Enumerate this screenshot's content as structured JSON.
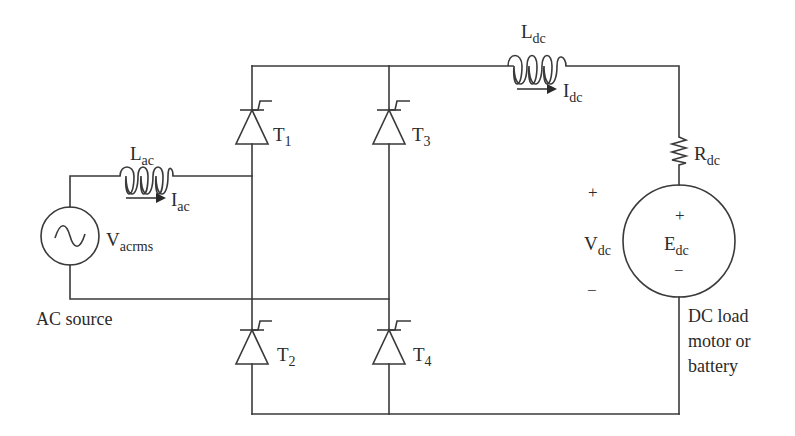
{
  "diagram": {
    "ac_side": {
      "source_label": "V",
      "source_sub": "acrms",
      "caption": "AC source",
      "inductor_label": "L",
      "inductor_sub": "ac",
      "current_label": "I",
      "current_sub": "ac"
    },
    "thyristors": [
      {
        "id": "T1",
        "label": "T",
        "sub": "1"
      },
      {
        "id": "T2",
        "label": "T",
        "sub": "2"
      },
      {
        "id": "T3",
        "label": "T",
        "sub": "3"
      },
      {
        "id": "T4",
        "label": "T",
        "sub": "4"
      }
    ],
    "dc_side": {
      "inductor_label": "L",
      "inductor_sub": "dc",
      "current_label": "I",
      "current_sub": "dc",
      "resistor_label": "R",
      "resistor_sub": "dc",
      "voltage_label": "V",
      "voltage_sub": "dc",
      "voltage_plus": "+",
      "voltage_minus": "−",
      "emf_label": "E",
      "emf_sub": "dc",
      "emf_plus": "+",
      "emf_minus": "−",
      "load_caption": [
        "DC load",
        "motor or",
        "battery"
      ]
    },
    "colors": {
      "line": "#3a3a3a",
      "text": "#2a2a2a",
      "background": "#ffffff"
    }
  }
}
